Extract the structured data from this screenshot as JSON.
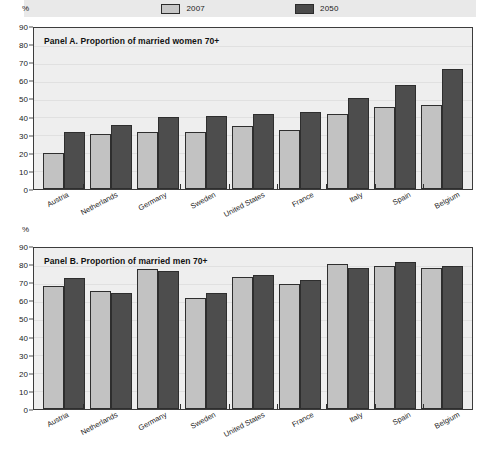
{
  "legend": {
    "entries": [
      {
        "label": "2007",
        "color": "#c2c2c2",
        "swatch": "legend-swatch-2007"
      },
      {
        "label": "2050",
        "color": "#4d4d4d",
        "swatch": "legend-swatch-2050"
      }
    ]
  },
  "axis": {
    "unit_symbol": "%",
    "ticks": [
      "90",
      "80",
      "70",
      "60",
      "50",
      "40",
      "30",
      "20",
      "10",
      "0"
    ]
  },
  "panelA": {
    "title": "Panel A.  Proportion of married women 70+"
  },
  "panelB": {
    "title": "Panel B.  Proportion of married men 70+"
  },
  "footnote": {
    "text": ""
  },
  "chart_data": [
    {
      "type": "bar",
      "title": "Panel A.  Proportion of married women 70+",
      "xlabel": "",
      "ylabel": "%",
      "ylim": [
        0,
        90
      ],
      "yticks": [
        0,
        10,
        20,
        30,
        40,
        50,
        60,
        70,
        80,
        90
      ],
      "grid": true,
      "legend_position": "top",
      "categories": [
        "Austria",
        "Netherlands",
        "Germany",
        "Sweden",
        "United States",
        "France",
        "Italy",
        "Spain",
        "Belgium"
      ],
      "series": [
        {
          "name": "2007",
          "color": "#c2c2c2",
          "values": [
            20,
            31,
            32,
            32,
            35,
            33,
            42,
            46,
            47
          ]
        },
        {
          "name": "2050",
          "color": "#4d4d4d",
          "values": [
            32,
            36,
            40,
            41,
            42,
            43,
            51,
            58,
            67
          ]
        }
      ]
    },
    {
      "type": "bar",
      "title": "Panel B.  Proportion of married men 70+",
      "xlabel": "",
      "ylabel": "%",
      "ylim": [
        0,
        90
      ],
      "yticks": [
        0,
        10,
        20,
        30,
        40,
        50,
        60,
        70,
        80,
        90
      ],
      "grid": true,
      "legend_position": "top",
      "categories": [
        "Austria",
        "Netherlands",
        "Germany",
        "Sweden",
        "United States",
        "France",
        "Italy",
        "Spain",
        "Belgium"
      ],
      "series": [
        {
          "name": "2007",
          "color": "#c2c2c2",
          "values": [
            69,
            66,
            78,
            62,
            74,
            70,
            81,
            80,
            79
          ]
        },
        {
          "name": "2050",
          "color": "#4d4d4d",
          "values": [
            73,
            65,
            77,
            65,
            75,
            72,
            79,
            82,
            80
          ]
        }
      ]
    }
  ]
}
